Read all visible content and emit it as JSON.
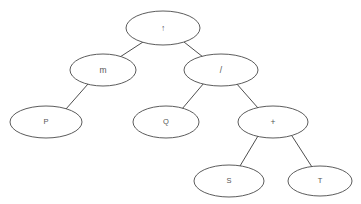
{
  "diagram": {
    "type": "binary-expression-tree",
    "background_color": "#ffffff",
    "node_fill": "#ffffff",
    "node_stroke": "#4a4a4a",
    "edge_stroke": "#3a3a3a",
    "label_color": "#555555",
    "nodes": [
      {
        "id": "n0",
        "label": "↑",
        "kind": "operator",
        "cx": 163,
        "cy": 28,
        "rx": 37,
        "ry": 17
      },
      {
        "id": "n1",
        "label": "m",
        "kind": "operator",
        "cx": 103,
        "cy": 70,
        "rx": 33,
        "ry": 16
      },
      {
        "id": "n2",
        "label": "/",
        "kind": "operator",
        "cx": 221,
        "cy": 70,
        "rx": 37,
        "ry": 16
      },
      {
        "id": "n3",
        "label": "P",
        "kind": "operand",
        "cx": 46,
        "cy": 122,
        "rx": 36,
        "ry": 16
      },
      {
        "id": "n4",
        "label": "Q",
        "kind": "operand",
        "cx": 166,
        "cy": 122,
        "rx": 33,
        "ry": 16
      },
      {
        "id": "n5",
        "label": "+",
        "kind": "operator",
        "cx": 273,
        "cy": 122,
        "rx": 35,
        "ry": 16
      },
      {
        "id": "n6",
        "label": "S",
        "kind": "operand",
        "cx": 229,
        "cy": 181,
        "rx": 35,
        "ry": 16
      },
      {
        "id": "n7",
        "label": "T",
        "kind": "operand",
        "cx": 320,
        "cy": 181,
        "rx": 32,
        "ry": 15
      }
    ],
    "edges": [
      {
        "id": "e0",
        "from": "n0",
        "to": "n1",
        "x1": 143,
        "y1": 42,
        "x2": 120,
        "y2": 57
      },
      {
        "id": "e1",
        "from": "n0",
        "to": "n2",
        "x1": 184,
        "y1": 42,
        "x2": 203,
        "y2": 57
      },
      {
        "id": "e2",
        "from": "n1",
        "to": "n3",
        "x1": 88,
        "y1": 84,
        "x2": 66,
        "y2": 109
      },
      {
        "id": "e3",
        "from": "n2",
        "to": "n4",
        "x1": 204,
        "y1": 83,
        "x2": 182,
        "y2": 109
      },
      {
        "id": "e4",
        "from": "n2",
        "to": "n5",
        "x1": 236,
        "y1": 83,
        "x2": 258,
        "y2": 108
      },
      {
        "id": "e5",
        "from": "n5",
        "to": "n6",
        "x1": 258,
        "y1": 136,
        "x2": 240,
        "y2": 166
      },
      {
        "id": "e6",
        "from": "n5",
        "to": "n7",
        "x1": 292,
        "y1": 136,
        "x2": 312,
        "y2": 167
      }
    ]
  }
}
